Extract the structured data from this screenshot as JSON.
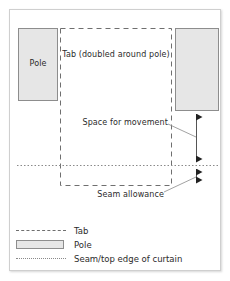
{
  "diagram": {
    "labels": {
      "pole": "Pole",
      "tab": "Tab (doubled around pole)",
      "space_for_movement": "Space for movement",
      "seam_allowance": "Seam allowance"
    },
    "colors": {
      "pole_fill": "#e6e6e6",
      "pole_stroke": "#8d8d8d",
      "tab_dash_stroke": "#6f6f6f",
      "seam_dot_stroke": "#8a8a8a",
      "arrow_stroke": "#222222",
      "leader_stroke": "#8a8a8a",
      "frame_border": "#cfcfcf",
      "text": "#2b2b2b",
      "background": "#ffffff"
    }
  },
  "legend": {
    "items": [
      {
        "swatch": "dashed-line",
        "label": "Tab"
      },
      {
        "swatch": "filled-rectangle",
        "label": "Pole"
      },
      {
        "swatch": "dotted-line",
        "label": "Seam/top edge of curtain"
      }
    ]
  }
}
